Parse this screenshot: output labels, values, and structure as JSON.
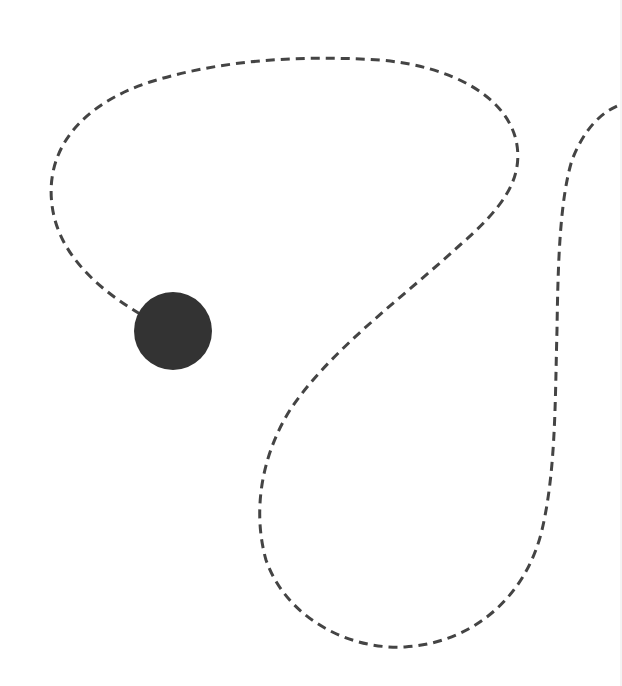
{
  "canvas": {
    "width": 622,
    "height": 686,
    "background": "#ffffff"
  },
  "path": {
    "stroke_color": "#444444",
    "stroke_width": 3,
    "dash_pattern": "9 6",
    "d": "M 140 314 C 100 290, 58 255, 52 205 C 45 150, 80 105, 150 82 C 220 60, 300 55, 380 60 C 450 66, 505 95, 516 140 C 525 180, 500 210, 460 245 C 400 300, 330 350, 290 410 C 262 455, 252 510, 266 560 C 285 615, 345 650, 405 647 C 470 643, 525 600, 542 530 C 556 470, 555 400, 557 330 C 558 260, 560 200, 572 160 C 584 130, 600 112, 622 104"
  },
  "marker": {
    "shape": "circle",
    "cx": 173,
    "cy": 331,
    "r": 39,
    "fill": "#333333"
  }
}
